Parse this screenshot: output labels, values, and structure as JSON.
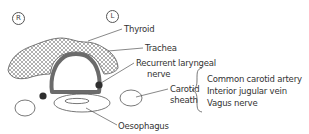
{
  "diagram": {
    "orientation": {
      "right_marker": "R",
      "left_marker": "L"
    },
    "labels": {
      "thyroid": "Thyroid",
      "trachea": "Trachea",
      "recurrent_laryngeal_1": "Recurrent laryngeal",
      "recurrent_laryngeal_2": "nerve",
      "carotid_sheath_1": "Carotid",
      "carotid_sheath_2": "sheath",
      "oesophagus": "Oesophagus"
    },
    "carotid_sheath_contents": [
      "Common carotid artery",
      "Interior jugular vein",
      "Vagus nerve"
    ],
    "colors": {
      "line": "#555555",
      "trachea_ring": "#6b6b6b",
      "nerve_dot": "#2f2f2f",
      "hatch": "#777777"
    }
  }
}
